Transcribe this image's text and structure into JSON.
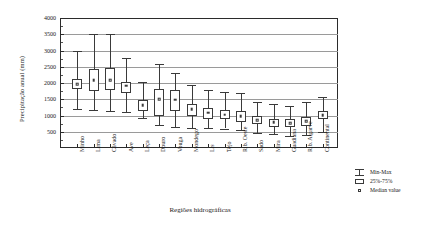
{
  "chart_data": {
    "type": "box",
    "title": "",
    "xlabel": "Regiões hidrográficas",
    "ylabel": "Precipitação anual (mm)",
    "ylim": [
      0,
      4000
    ],
    "yticks": [
      500,
      1000,
      1500,
      2000,
      2500,
      3000,
      3500,
      4000
    ],
    "grid": true,
    "legend_position": "right",
    "categories": [
      "Minho",
      "Lima",
      "Cávado",
      "Ave",
      "Leça",
      "Douro",
      "Vouga",
      "Mondego",
      "Lis",
      "Tejo",
      "Rib. Oeste",
      "Sado",
      "Mira",
      "Guadiana",
      "Rib. Algarve",
      "Continental"
    ],
    "series": [
      {
        "name": "min",
        "values": [
          1210,
          1180,
          1150,
          1100,
          930,
          700,
          650,
          620,
          610,
          600,
          560,
          470,
          430,
          380,
          400,
          500
        ]
      },
      {
        "name": "q1",
        "values": [
          1800,
          1760,
          1790,
          1680,
          1140,
          980,
          1150,
          980,
          900,
          880,
          810,
          740,
          660,
          640,
          680,
          880
        ]
      },
      {
        "name": "median",
        "values": [
          1960,
          2090,
          2090,
          1920,
          1320,
          1500,
          1480,
          1200,
          1080,
          1030,
          980,
          860,
          790,
          760,
          830,
          1010
        ]
      },
      {
        "name": "q3",
        "values": [
          2110,
          2440,
          2450,
          2040,
          1480,
          1830,
          1800,
          1360,
          1220,
          1180,
          1140,
          990,
          900,
          880,
          960,
          1130
        ]
      },
      {
        "name": "max",
        "values": [
          2990,
          3520,
          3520,
          2760,
          2030,
          2600,
          2300,
          1940,
          1780,
          1720,
          1700,
          1430,
          1340,
          1300,
          1420,
          1580
        ]
      }
    ]
  },
  "legend": {
    "items": [
      {
        "key": "minmax",
        "label": "Min-Max"
      },
      {
        "key": "iqr",
        "label": "25%-75%"
      },
      {
        "key": "median",
        "label": "Median value"
      }
    ]
  }
}
